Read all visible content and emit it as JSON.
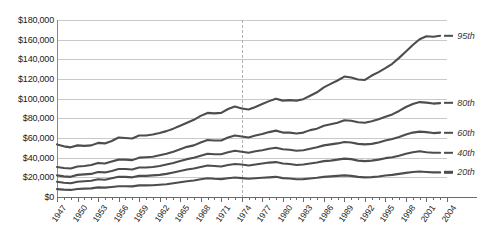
{
  "chart_data": {
    "type": "line",
    "title": "",
    "subtitle": "",
    "xlabel": "",
    "ylabel": "",
    "grid": true,
    "legend_position": "right-inline",
    "ylim": [
      0,
      180000
    ],
    "xlim": [
      1947,
      2004
    ],
    "y_ticks": [
      0,
      20000,
      40000,
      60000,
      80000,
      100000,
      120000,
      140000,
      160000,
      180000
    ],
    "y_tick_labels": [
      "$0",
      "$20,000",
      "$40,000",
      "$60,000",
      "$80,000",
      "$100,000",
      "$120,000",
      "$140,000",
      "$160,000",
      "$180,000"
    ],
    "x_tick_labels": [
      "1947",
      "1950",
      "1953",
      "1956",
      "1959",
      "1962",
      "1965",
      "1968",
      "1971",
      "1974",
      "1977",
      "1980",
      "1983",
      "1986",
      "1989",
      "1992",
      "1995",
      "1998",
      "2001",
      "2004"
    ],
    "x_tick_years": [
      1947,
      1950,
      1953,
      1956,
      1959,
      1962,
      1965,
      1968,
      1971,
      1974,
      1977,
      1980,
      1983,
      1986,
      1989,
      1992,
      1995,
      1998,
      2001,
      2004
    ],
    "annotations": [
      {
        "type": "vertical-dashed-line",
        "x": 1974,
        "label": ""
      }
    ],
    "x": [
      1947,
      1948,
      1949,
      1950,
      1951,
      1952,
      1953,
      1954,
      1955,
      1956,
      1957,
      1958,
      1959,
      1960,
      1961,
      1962,
      1963,
      1964,
      1965,
      1966,
      1967,
      1968,
      1969,
      1970,
      1971,
      1972,
      1973,
      1974,
      1975,
      1976,
      1977,
      1978,
      1979,
      1980,
      1981,
      1982,
      1983,
      1984,
      1985,
      1986,
      1987,
      1988,
      1989,
      1990,
      1991,
      1992,
      1993,
      1994,
      1995,
      1996,
      1997,
      1998,
      1999,
      2000,
      2001,
      2002,
      2003
    ],
    "series": [
      {
        "name": "95th",
        "label": "95th",
        "color": "#4d4d4d",
        "values": [
          53500,
          51500,
          50500,
          52500,
          52000,
          52500,
          55000,
          54500,
          57000,
          60500,
          60000,
          59500,
          62500,
          62500,
          63500,
          65000,
          67000,
          69500,
          72500,
          75500,
          78500,
          82500,
          85500,
          85000,
          85500,
          89500,
          92000,
          90000,
          89000,
          91500,
          94500,
          97500,
          100000,
          98000,
          98500,
          98000,
          99500,
          103000,
          106500,
          111500,
          115000,
          118500,
          122500,
          121500,
          119500,
          119000,
          123500,
          127000,
          131000,
          135500,
          141500,
          148000,
          154500,
          160500,
          163500,
          163000,
          164000
        ]
      },
      {
        "name": "80th",
        "label": "80th",
        "color": "#4d4d4d",
        "values": [
          30500,
          29500,
          29000,
          31000,
          31500,
          32500,
          34500,
          34000,
          36000,
          38000,
          38000,
          37500,
          40000,
          40500,
          41000,
          42500,
          44000,
          46000,
          48500,
          51000,
          52500,
          55500,
          58000,
          57500,
          57500,
          60500,
          62500,
          61500,
          60500,
          62500,
          64000,
          66000,
          67500,
          65500,
          65500,
          64500,
          65500,
          68000,
          69500,
          72500,
          74000,
          75500,
          78000,
          77500,
          76000,
          75500,
          77000,
          79000,
          81500,
          84000,
          87500,
          91500,
          94500,
          96500,
          96000,
          95000,
          95500
        ]
      },
      {
        "name": "60th",
        "label": "60th",
        "color": "#4d4d4d",
        "values": [
          22000,
          21000,
          20500,
          22500,
          23000,
          23500,
          25500,
          25000,
          26500,
          28500,
          28500,
          28000,
          30000,
          30000,
          30500,
          31500,
          33000,
          34500,
          36500,
          38500,
          40000,
          42000,
          44000,
          43500,
          43500,
          45500,
          47000,
          46000,
          45000,
          46500,
          47500,
          49000,
          50000,
          48500,
          48000,
          47000,
          47500,
          49000,
          50500,
          52500,
          53500,
          54500,
          56000,
          55500,
          54000,
          53500,
          54000,
          55500,
          57500,
          59000,
          61000,
          63500,
          65500,
          66500,
          66000,
          65000,
          65500
        ]
      },
      {
        "name": "40th",
        "label": "40th",
        "color": "#4d4d4d",
        "values": [
          15500,
          14500,
          14000,
          15500,
          16000,
          16500,
          18000,
          17500,
          19000,
          20500,
          20500,
          20000,
          21500,
          21500,
          22000,
          22500,
          23500,
          25000,
          26500,
          28000,
          29000,
          30500,
          32000,
          31500,
          31000,
          32500,
          33500,
          33000,
          32000,
          33000,
          34000,
          35000,
          35500,
          34000,
          33500,
          32500,
          33000,
          34000,
          35000,
          36500,
          37000,
          38000,
          39000,
          38500,
          37000,
          36500,
          37000,
          38000,
          39500,
          40500,
          42000,
          44000,
          45500,
          46500,
          45500,
          45000,
          45000
        ]
      },
      {
        "name": "20th",
        "label": "20th",
        "color": "#4d4d4d",
        "values": [
          8000,
          7500,
          7200,
          8200,
          8500,
          8800,
          9800,
          9500,
          10200,
          11000,
          11000,
          10800,
          11800,
          11800,
          12000,
          12500,
          13000,
          14000,
          15000,
          16000,
          16800,
          18000,
          19000,
          18500,
          18200,
          19000,
          19800,
          19200,
          18500,
          19000,
          19500,
          20000,
          20500,
          19200,
          18800,
          18000,
          18200,
          18800,
          19500,
          20500,
          21000,
          21500,
          22000,
          21500,
          20500,
          20000,
          20200,
          20800,
          21800,
          22500,
          23500,
          24500,
          25500,
          26000,
          25500,
          25000,
          25000
        ]
      }
    ]
  },
  "axis": {
    "y_title": "",
    "x_title": ""
  }
}
